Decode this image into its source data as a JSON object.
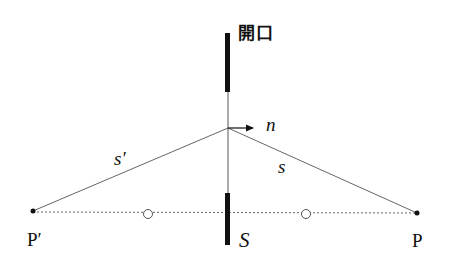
{
  "diagram": {
    "labels": {
      "aperture": "開口",
      "normal": "n",
      "s_prime": "s′",
      "s": "s",
      "p_prime": "P′",
      "screen": "S",
      "p": "P"
    },
    "colors": {
      "line": "#555555",
      "bar": "#111111",
      "text": "#111111",
      "background": "#ffffff"
    },
    "elements": {
      "screen_top_bar": {
        "x": 226,
        "y1": 33,
        "y2": 92
      },
      "screen_bottom_bar": {
        "x": 226,
        "y1": 193,
        "y2": 245
      },
      "aperture_line": {
        "x": 228,
        "y1": 92,
        "y2": 193
      },
      "vertex": {
        "x": 228,
        "y": 128
      },
      "point_p_prime": {
        "x": 33,
        "y": 211
      },
      "point_p": {
        "x": 417,
        "y": 213
      },
      "circle_left": {
        "x": 148,
        "y": 214
      },
      "circle_right": {
        "x": 306,
        "y": 214
      }
    }
  }
}
